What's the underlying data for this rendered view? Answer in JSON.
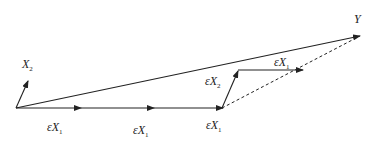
{
  "diagram": {
    "title": "",
    "labels": {
      "x2": {
        "main": "X",
        "sub": "2"
      },
      "y": {
        "main": "Y"
      },
      "step1": {
        "eps": "ε",
        "main": "X",
        "sub": "1"
      },
      "step2": {
        "eps": "ε",
        "main": "X",
        "sub": "1"
      },
      "step3": {
        "eps": "ε",
        "main": "X",
        "sub": "1"
      },
      "step4": {
        "eps": "ε",
        "main": "X",
        "sub": "2"
      },
      "step5": {
        "eps": "ε",
        "main": "X",
        "sub": "1"
      }
    },
    "colors": {
      "line": "#222222",
      "background": "#ffffff"
    },
    "nodes": {
      "origin": [
        16,
        108
      ],
      "x2_tip": [
        28,
        80
      ],
      "p1": [
        80,
        108
      ],
      "p2": [
        153,
        108
      ],
      "p3": [
        222,
        108
      ],
      "p4": [
        238,
        70
      ],
      "p5": [
        302,
        70
      ],
      "y_tip": [
        360,
        36
      ]
    }
  }
}
